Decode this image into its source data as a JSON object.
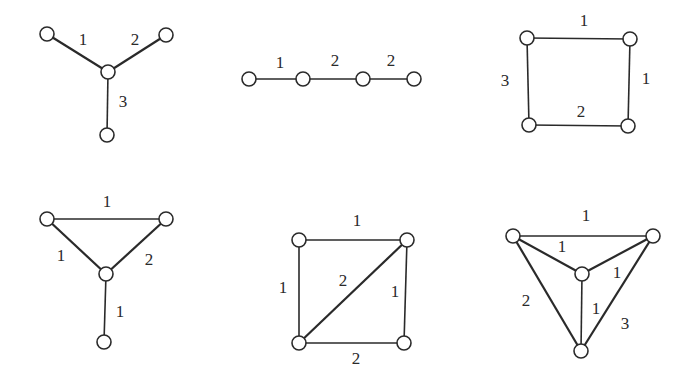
{
  "figure": {
    "graphs": [
      {
        "id": "g1",
        "name": "star-3",
        "nodes": [
          {
            "id": "a",
            "x": 47,
            "y": 34
          },
          {
            "id": "b",
            "x": 166,
            "y": 35
          },
          {
            "id": "c",
            "x": 108,
            "y": 72
          },
          {
            "id": "d",
            "x": 107,
            "y": 135
          }
        ],
        "edges": [
          {
            "from": "a",
            "to": "c",
            "weight": "1",
            "lx": 83,
            "ly": 41,
            "thick": true
          },
          {
            "from": "b",
            "to": "c",
            "weight": "2",
            "lx": 135,
            "ly": 41,
            "thick": true
          },
          {
            "from": "c",
            "to": "d",
            "weight": "3",
            "lx": 123,
            "ly": 103,
            "thick": false
          }
        ]
      },
      {
        "id": "g2",
        "name": "path-4",
        "nodes": [
          {
            "id": "a",
            "x": 249,
            "y": 79
          },
          {
            "id": "b",
            "x": 303,
            "y": 79
          },
          {
            "id": "c",
            "x": 363,
            "y": 79
          },
          {
            "id": "d",
            "x": 414,
            "y": 79
          }
        ],
        "edges": [
          {
            "from": "a",
            "to": "b",
            "weight": "1",
            "lx": 280,
            "ly": 64,
            "thick": false
          },
          {
            "from": "b",
            "to": "c",
            "weight": "2",
            "lx": 335,
            "ly": 62,
            "thick": false
          },
          {
            "from": "c",
            "to": "d",
            "weight": "2",
            "lx": 391,
            "ly": 62,
            "thick": false
          }
        ]
      },
      {
        "id": "g3",
        "name": "cycle-4",
        "nodes": [
          {
            "id": "a",
            "x": 527,
            "y": 38
          },
          {
            "id": "b",
            "x": 630,
            "y": 39
          },
          {
            "id": "c",
            "x": 529,
            "y": 125
          },
          {
            "id": "d",
            "x": 628,
            "y": 126
          }
        ],
        "edges": [
          {
            "from": "a",
            "to": "b",
            "weight": "1",
            "lx": 584,
            "ly": 22,
            "thick": false
          },
          {
            "from": "b",
            "to": "d",
            "weight": "1",
            "lx": 646,
            "ly": 80,
            "thick": false
          },
          {
            "from": "c",
            "to": "d",
            "weight": "2",
            "lx": 581,
            "ly": 113,
            "thick": false
          },
          {
            "from": "a",
            "to": "c",
            "weight": "3",
            "lx": 505,
            "ly": 82,
            "thick": false
          }
        ]
      },
      {
        "id": "g4",
        "name": "triangle-with-pendant",
        "nodes": [
          {
            "id": "a",
            "x": 47,
            "y": 219
          },
          {
            "id": "b",
            "x": 166,
            "y": 219
          },
          {
            "id": "c",
            "x": 106,
            "y": 274
          },
          {
            "id": "d",
            "x": 104,
            "y": 342
          }
        ],
        "edges": [
          {
            "from": "a",
            "to": "b",
            "weight": "1",
            "lx": 107,
            "ly": 203,
            "thick": false
          },
          {
            "from": "a",
            "to": "c",
            "weight": "1",
            "lx": 61,
            "ly": 257,
            "thick": true
          },
          {
            "from": "b",
            "to": "c",
            "weight": "2",
            "lx": 149,
            "ly": 261,
            "thick": true
          },
          {
            "from": "c",
            "to": "d",
            "weight": "1",
            "lx": 120,
            "ly": 313,
            "thick": false
          }
        ]
      },
      {
        "id": "g5",
        "name": "square-with-diagonal",
        "nodes": [
          {
            "id": "a",
            "x": 299,
            "y": 240
          },
          {
            "id": "b",
            "x": 407,
            "y": 240
          },
          {
            "id": "c",
            "x": 299,
            "y": 343
          },
          {
            "id": "d",
            "x": 404,
            "y": 343
          }
        ],
        "edges": [
          {
            "from": "a",
            "to": "b",
            "weight": "1",
            "lx": 357,
            "ly": 222,
            "thick": false
          },
          {
            "from": "a",
            "to": "c",
            "weight": "1",
            "lx": 283,
            "ly": 289,
            "thick": false
          },
          {
            "from": "c",
            "to": "b",
            "weight": "2",
            "lx": 343,
            "ly": 282,
            "thick": true
          },
          {
            "from": "b",
            "to": "d",
            "weight": "1",
            "lx": 395,
            "ly": 293,
            "thick": false
          },
          {
            "from": "c",
            "to": "d",
            "weight": "2",
            "lx": 356,
            "ly": 360,
            "thick": false
          }
        ]
      },
      {
        "id": "g6",
        "name": "wheel-k4",
        "nodes": [
          {
            "id": "a",
            "x": 513,
            "y": 236
          },
          {
            "id": "b",
            "x": 653,
            "y": 236
          },
          {
            "id": "c",
            "x": 582,
            "y": 274
          },
          {
            "id": "d",
            "x": 581,
            "y": 351
          }
        ],
        "edges": [
          {
            "from": "a",
            "to": "b",
            "weight": "1",
            "lx": 586,
            "ly": 217,
            "thick": false
          },
          {
            "from": "a",
            "to": "c",
            "weight": "1",
            "lx": 562,
            "ly": 248,
            "thick": true
          },
          {
            "from": "b",
            "to": "c",
            "weight": "1",
            "lx": 617,
            "ly": 274,
            "thick": true
          },
          {
            "from": "c",
            "to": "d",
            "weight": "1",
            "lx": 596,
            "ly": 310,
            "thick": false
          },
          {
            "from": "a",
            "to": "d",
            "weight": "2",
            "lx": 526,
            "ly": 302,
            "thick": true
          },
          {
            "from": "b",
            "to": "d",
            "weight": "3",
            "lx": 625,
            "ly": 325,
            "thick": true
          }
        ]
      }
    ],
    "node_radius": 7,
    "colors": {
      "stroke": "#2a2a2a",
      "background": "#ffffff",
      "node_fill": "#ffffff"
    }
  }
}
